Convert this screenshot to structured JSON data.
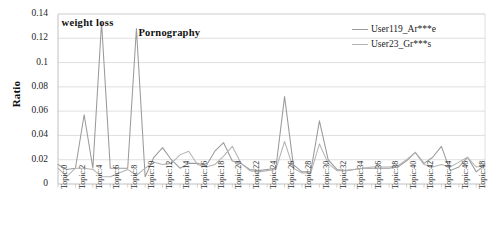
{
  "chart_data": {
    "type": "line",
    "title": "",
    "xlabel": "",
    "ylabel": "Ratio",
    "ylim": [
      0,
      0.14
    ],
    "ytick_labels": [
      "0",
      "0.02",
      "0.04",
      "0.06",
      "0.08",
      "0.1",
      "0.12",
      "0.14"
    ],
    "ytick_values": [
      0,
      0.02,
      0.04,
      0.06,
      0.08,
      0.1,
      0.12,
      0.14
    ],
    "grid": true,
    "legend_position": "top-right",
    "categories": [
      "Topic:0",
      "Topic:1",
      "Topic:2",
      "Topic:3",
      "Topic:4",
      "Topic:5",
      "Topic:6",
      "Topic:7",
      "Topic:8",
      "Topic:9",
      "Topic:10",
      "Topic:11",
      "Topic:12",
      "Topic:13",
      "Topic:14",
      "Topic:15",
      "Topic:16",
      "Topic:17",
      "Topic:18",
      "Topic:19",
      "Topic:20",
      "Topic:21",
      "Topic:22",
      "Topic:23",
      "Topic:24",
      "Topic:25",
      "Topic:26",
      "Topic:27",
      "Topic:28",
      "Topic:29",
      "Topic:30",
      "Topic:31",
      "Topic:32",
      "Topic:33",
      "Topic:34",
      "Topic:35",
      "Topic:36",
      "Topic:37",
      "Topic:38",
      "Topic:39",
      "Topic:40",
      "Topic:41",
      "Topic:42",
      "Topic:43",
      "Topic:44",
      "Topic:45",
      "Topic:46",
      "Topic:47",
      "Topic:48",
      "Topic:49"
    ],
    "xtick_labels": [
      "Topic:0",
      "Topic:2",
      "Topic:4",
      "Topic:6",
      "Topic:8",
      "Topic:10",
      "Topic:12",
      "Topic:14",
      "Topic:16",
      "Topic:18",
      "Topic:20",
      "Topic:22",
      "Topic:24",
      "Topic:26",
      "Topic:28",
      "Topic:30",
      "Topic:32",
      "Topic:34",
      "Topic:36",
      "Topic:38",
      "Topic:40",
      "Topic:42",
      "Topic:44",
      "Topic:46",
      "Topic:48"
    ],
    "series": [
      {
        "name": "User119_Ar***e",
        "color": "#9a9a9a",
        "values": [
          0.016,
          0.012,
          0.013,
          0.057,
          0.013,
          0.133,
          0.013,
          0.013,
          0.013,
          0.128,
          0.006,
          0.022,
          0.03,
          0.02,
          0.013,
          0.017,
          0.017,
          0.015,
          0.027,
          0.034,
          0.019,
          0.017,
          0.012,
          0.011,
          0.012,
          0.013,
          0.072,
          0.016,
          0.01,
          0.01,
          0.052,
          0.02,
          0.012,
          0.011,
          0.012,
          0.013,
          0.013,
          0.013,
          0.013,
          0.014,
          0.019,
          0.026,
          0.017,
          0.022,
          0.031,
          0.011,
          0.014,
          0.022,
          0.01,
          0.016
        ]
      },
      {
        "name": "User23_Gr***s",
        "color": "#b4b4b4",
        "values": [
          0.013,
          0.006,
          0.013,
          0.013,
          0.012,
          0.006,
          0.006,
          0.009,
          0.012,
          0.007,
          0.013,
          0.018,
          0.016,
          0.017,
          0.024,
          0.027,
          0.016,
          0.014,
          0.016,
          0.023,
          0.031,
          0.017,
          0.011,
          0.01,
          0.011,
          0.012,
          0.035,
          0.013,
          0.009,
          0.009,
          0.033,
          0.017,
          0.011,
          0.011,
          0.012,
          0.013,
          0.014,
          0.014,
          0.014,
          0.015,
          0.02,
          0.026,
          0.016,
          0.014,
          0.016,
          0.014,
          0.018,
          0.022,
          0.014,
          0.015
        ]
      }
    ],
    "annotations": [
      {
        "text": "weight  loss",
        "topic": "Topic:5",
        "value": 0.133
      },
      {
        "text": "Pornography",
        "topic": "Topic:9",
        "value": 0.128
      }
    ]
  },
  "legend": {
    "entries": [
      {
        "label": "User119_Ar***e",
        "color": "#9a9a9a"
      },
      {
        "label": "User23_Gr***s",
        "color": "#b4b4b4"
      }
    ]
  }
}
